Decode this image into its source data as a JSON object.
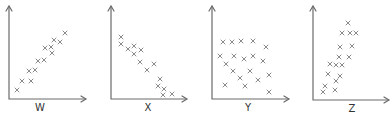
{
  "chart_data": [
    {
      "type": "scatter",
      "title": "",
      "xlabel": "W",
      "ylabel": "",
      "grid": false,
      "ticks": "none",
      "correlation": "strong positive",
      "points_px": [
        [
          17,
          90
        ],
        [
          22,
          81
        ],
        [
          31,
          81
        ],
        [
          29,
          71
        ],
        [
          35,
          70
        ],
        [
          38,
          61
        ],
        [
          44,
          60
        ],
        [
          45,
          48
        ],
        [
          51,
          47
        ],
        [
          52,
          53
        ],
        [
          54,
          40
        ],
        [
          60,
          42
        ],
        [
          65,
          33
        ]
      ]
    },
    {
      "type": "scatter",
      "title": "",
      "xlabel": "X",
      "ylabel": "",
      "grid": false,
      "ticks": "none",
      "correlation": "strong negative",
      "points_px": [
        [
          121,
          37
        ],
        [
          121,
          44
        ],
        [
          128,
          49
        ],
        [
          134,
          46
        ],
        [
          134,
          54
        ],
        [
          141,
          50
        ],
        [
          140,
          62
        ],
        [
          147,
          70
        ],
        [
          154,
          64
        ],
        [
          160,
          79
        ],
        [
          158,
          86
        ],
        [
          164,
          89
        ],
        [
          163,
          95
        ],
        [
          172,
          94
        ]
      ]
    },
    {
      "type": "scatter",
      "title": "",
      "xlabel": "Y",
      "ylabel": "",
      "grid": false,
      "ticks": "none",
      "correlation": "none",
      "points_px": [
        [
          223,
          42
        ],
        [
          232,
          42
        ],
        [
          241,
          41
        ],
        [
          253,
          41
        ],
        [
          266,
          47
        ],
        [
          220,
          56
        ],
        [
          234,
          56
        ],
        [
          244,
          59
        ],
        [
          253,
          56
        ],
        [
          263,
          61
        ],
        [
          226,
          64
        ],
        [
          233,
          71
        ],
        [
          250,
          71
        ],
        [
          240,
          78
        ],
        [
          258,
          80
        ],
        [
          269,
          75
        ],
        [
          225,
          85
        ],
        [
          245,
          86
        ],
        [
          269,
          92
        ]
      ]
    },
    {
      "type": "scatter",
      "title": "",
      "xlabel": "Z",
      "ylabel": "",
      "grid": false,
      "ticks": "none",
      "correlation": "strong positive (steep)",
      "points_px": [
        [
          348,
          23
        ],
        [
          342,
          33
        ],
        [
          350,
          33
        ],
        [
          356,
          33
        ],
        [
          340,
          47
        ],
        [
          352,
          46
        ],
        [
          339,
          57
        ],
        [
          349,
          57
        ],
        [
          330,
          64
        ],
        [
          336,
          65
        ],
        [
          342,
          65
        ],
        [
          328,
          74
        ],
        [
          340,
          76
        ],
        [
          336,
          81
        ],
        [
          325,
          86
        ],
        [
          335,
          90
        ],
        [
          323,
          92
        ]
      ]
    }
  ],
  "plots": [
    {
      "label": "W",
      "axis": {
        "x0": 9,
        "ytop": 6,
        "ybase": 99,
        "xend": 86
      },
      "label_pos": [
        40,
        102
      ]
    },
    {
      "label": "X",
      "axis": {
        "x0": 111,
        "ytop": 6,
        "ybase": 99,
        "xend": 187
      },
      "label_pos": [
        148,
        102
      ]
    },
    {
      "label": "Y",
      "axis": {
        "x0": 212,
        "ytop": 6,
        "ybase": 99,
        "xend": 289
      },
      "label_pos": [
        248,
        102
      ]
    },
    {
      "label": "Z",
      "axis": {
        "x0": 313,
        "ytop": 6,
        "ybase": 100,
        "xend": 389
      },
      "label_pos": [
        352,
        103
      ]
    }
  ],
  "colors": {
    "axis": "#6a6a6a",
    "marker": "#8a8a8a",
    "label": "#333333"
  }
}
